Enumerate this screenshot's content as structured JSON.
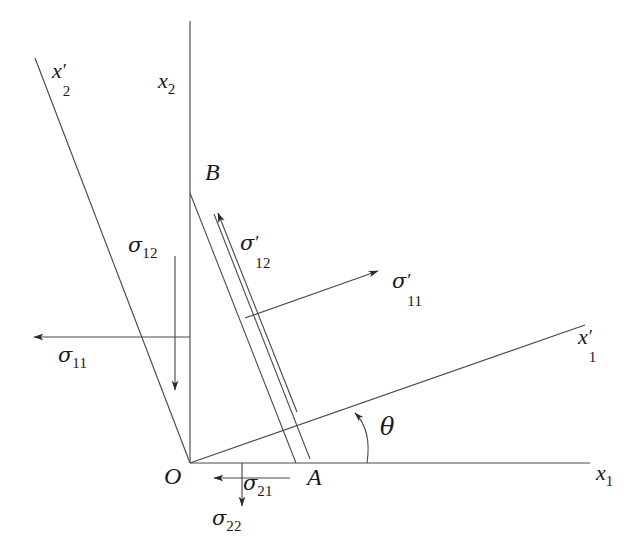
{
  "figure": {
    "kind": "stress-transformation-diagram",
    "background_color": "#ffffff",
    "line_color": "#3a3a3a",
    "text_color": "#1a1a1a",
    "width": 639,
    "height": 546
  },
  "axes": {
    "x1": {
      "label_base": "x",
      "label_sub": "1",
      "label_prime": ""
    },
    "x2": {
      "label_base": "x",
      "label_sub": "2",
      "label_prime": ""
    },
    "x1p": {
      "label_base": "x",
      "label_sub": "1",
      "label_prime": "′"
    },
    "x2p": {
      "label_base": "x",
      "label_sub": "2",
      "label_prime": "′"
    }
  },
  "points": {
    "origin": "O",
    "a": "A",
    "b": "B"
  },
  "angle": {
    "label": "θ"
  },
  "stresses": [
    {
      "name": "sigma-11",
      "symbol": "σ",
      "sub": "11",
      "prime": "",
      "direction": "left"
    },
    {
      "name": "sigma-12",
      "symbol": "σ",
      "sub": "12",
      "prime": "",
      "direction": "down"
    },
    {
      "name": "sigma-21",
      "symbol": "σ",
      "sub": "21",
      "prime": "",
      "direction": "left"
    },
    {
      "name": "sigma-22",
      "symbol": "σ",
      "sub": "22",
      "prime": "",
      "direction": "down"
    },
    {
      "name": "sigma-11p",
      "symbol": "σ",
      "sub": "11",
      "prime": "′",
      "direction": "up-right"
    },
    {
      "name": "sigma-12p",
      "symbol": "σ",
      "sub": "12",
      "prime": "′",
      "direction": "up-left"
    }
  ],
  "labels": {
    "sigma": "σ",
    "x": "x",
    "prime": "′",
    "sub_1": "1",
    "sub_2": "2",
    "sub_11": "11",
    "sub_12": "12",
    "sub_21": "21",
    "sub_22": "22",
    "theta": "θ",
    "O": "O",
    "A": "A",
    "B": "B"
  }
}
